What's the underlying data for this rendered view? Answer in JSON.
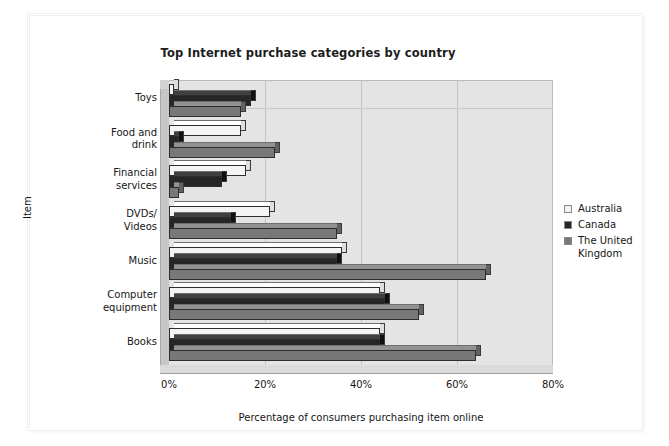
{
  "chart_data": {
    "type": "bar",
    "orientation": "horizontal",
    "title": "Top Internet purchase categories by country",
    "xlabel": "Percentage of consumers purchasing item online",
    "ylabel": "Item",
    "xlim": [
      0,
      80
    ],
    "xticks": [
      "0%",
      "20%",
      "40%",
      "60%",
      "80%"
    ],
    "xtick_values": [
      0,
      20,
      40,
      60,
      80
    ],
    "grid": true,
    "legend_position": "right",
    "categories": [
      "Toys",
      "Food and drink",
      "Financial services",
      "DVDs/ Videos",
      "Music",
      "Computer equipment",
      "Books"
    ],
    "category_lines": [
      [
        "Toys"
      ],
      [
        "Food and",
        "drink"
      ],
      [
        "Financial",
        "services"
      ],
      [
        "DVDs/",
        "Videos"
      ],
      [
        "Music"
      ],
      [
        "Computer",
        "equipment"
      ],
      [
        "Books"
      ]
    ],
    "series": [
      {
        "name": "Australia",
        "color": "#f4f4f4",
        "values": [
          1,
          15,
          16,
          21,
          36,
          44,
          44
        ]
      },
      {
        "name": "Canada",
        "color": "#262626",
        "values": [
          17,
          2,
          11,
          13,
          35,
          45,
          44
        ]
      },
      {
        "name": "The United Kingdom",
        "color": "#787878",
        "values": [
          15,
          22,
          2,
          35,
          66,
          52,
          64
        ]
      }
    ],
    "legend": [
      {
        "label": "Australia",
        "color": "#f4f4f4"
      },
      {
        "label": "Canada",
        "color": "#262626"
      },
      {
        "label": "The United Kingdom",
        "color": "#787878"
      }
    ],
    "legend_lines": [
      [
        "Australia"
      ],
      [
        "Canada"
      ],
      [
        "The United",
        "Kingdom"
      ]
    ]
  }
}
